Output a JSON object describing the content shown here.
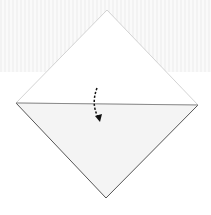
{
  "diagram": {
    "type": "origami-fold-step",
    "shape": "square-on-point",
    "vertices": {
      "top": [
        107,
        10
      ],
      "left": [
        16,
        103
      ],
      "right": [
        198,
        105
      ],
      "bottom": [
        106,
        198
      ]
    },
    "fold_line": {
      "from": [
        16,
        103
      ],
      "to": [
        198,
        105
      ]
    },
    "arrow": {
      "style": "dashed-curved",
      "direction": "down",
      "path": "M97 88 Q91 104 99 121"
    },
    "colors": {
      "background": "#ffffff",
      "band": "#f3f3f3",
      "upper_face": "#ffffff",
      "lower_face": "#f4f4f4",
      "outline_light": "#c8c8c8",
      "outline_dark": "#555555",
      "fold_line": "#8a8a8a",
      "arrow": "#111111"
    }
  }
}
